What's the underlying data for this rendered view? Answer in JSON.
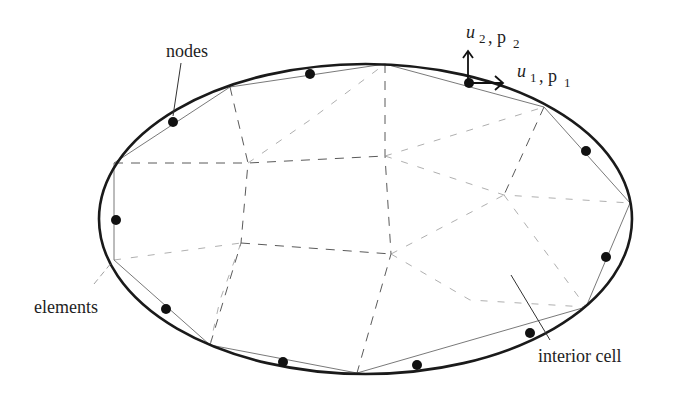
{
  "figure": {
    "width": 680,
    "height": 394,
    "colors": {
      "boundary": "#1a1a1a",
      "node": "#111111",
      "element_edge": "#6a6a6a",
      "cell_edge": "#5a5a5a",
      "background": "#ffffff"
    }
  },
  "labels": {
    "nodes": "nodes",
    "elements": "elements",
    "interior_cell": "interior cell",
    "u2_var": "u",
    "u2_sub": "2",
    "p2_main": ", p",
    "p2_sub": "2",
    "u1_var": "u",
    "u1_sub": "1",
    "p1_main": ", p",
    "p1_sub": "1"
  },
  "diagram": {
    "boundary_ellipse": {
      "cx": 365.5,
      "cy": 219,
      "rx": 266.5,
      "ry": 155
    },
    "boundary_element_vertices": [
      [
        385,
        64
      ],
      [
        544,
        107
      ],
      [
        630,
        203
      ],
      [
        586,
        307
      ],
      [
        357,
        373
      ],
      [
        210,
        345
      ],
      [
        114,
        260
      ],
      [
        114,
        163
      ],
      [
        230,
        87
      ]
    ],
    "nodes": [
      [
        310,
        74
      ],
      [
        469,
        83
      ],
      [
        586,
        151
      ],
      [
        606,
        257
      ],
      [
        530,
        333
      ],
      [
        417,
        365
      ],
      [
        283,
        362
      ],
      [
        166,
        309
      ],
      [
        116,
        220
      ],
      [
        173,
        122
      ]
    ],
    "interior_vertices": {
      "a": [
        248,
        163
      ],
      "b": [
        385,
        156
      ],
      "c": [
        504,
        195
      ],
      "d": [
        241,
        243
      ],
      "e": [
        391,
        254
      ]
    },
    "traction_vectors": {
      "origin": [
        469,
        83
      ],
      "u1_tip": [
        502,
        83
      ],
      "u2_tip": [
        469,
        51
      ]
    }
  }
}
